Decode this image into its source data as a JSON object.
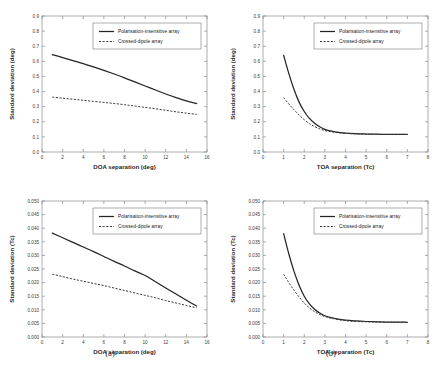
{
  "figure": {
    "caption_a": "(a)",
    "caption_b": "(b)"
  },
  "legend": {
    "series_solid": "Polarisation-insensitive array",
    "series_dashed": "Crossed-dipole array"
  },
  "chart_data": [
    {
      "id": "top-left",
      "type": "line",
      "title": "",
      "xlabel": "DOA separation (deg)",
      "ylabel": "Standard deviation (deg)",
      "xlim": [
        0,
        16
      ],
      "ylim": [
        0,
        0.9
      ],
      "xticks": [
        0,
        2,
        4,
        6,
        8,
        10,
        12,
        14,
        16
      ],
      "xticklabels": [
        "0",
        "2",
        "4",
        "6",
        "8",
        "10",
        "12",
        "14",
        "16"
      ],
      "yticks": [
        0,
        0.1,
        0.2,
        0.3,
        0.4,
        0.5,
        0.6,
        0.7,
        0.8,
        0.9
      ],
      "yticklabels": [
        "0.0",
        "0.1",
        "0.2",
        "0.3",
        "0.4",
        "0.5",
        "0.6",
        "0.7",
        "0.8",
        "0.9"
      ],
      "grid": false,
      "legend_position": "upper right",
      "x": [
        1,
        2,
        3,
        4,
        5,
        6,
        7,
        8,
        9,
        10,
        11,
        12,
        13,
        14,
        15
      ],
      "series": [
        {
          "name": "Polarisation-insensitive array",
          "style": "solid",
          "values": [
            0.645,
            0.625,
            0.605,
            0.585,
            0.563,
            0.54,
            0.516,
            0.491,
            0.464,
            0.437,
            0.41,
            0.384,
            0.36,
            0.338,
            0.32
          ]
        },
        {
          "name": "Crossed-dipole array",
          "style": "dashed",
          "values": [
            0.363,
            0.356,
            0.349,
            0.342,
            0.335,
            0.328,
            0.321,
            0.313,
            0.304,
            0.295,
            0.286,
            0.276,
            0.266,
            0.257,
            0.249
          ]
        }
      ]
    },
    {
      "id": "top-right",
      "type": "line",
      "title": "",
      "xlabel": "TOA separation (Tc)",
      "ylabel": "Standard deviation (deg)",
      "xlim": [
        0,
        8
      ],
      "ylim": [
        0,
        0.9
      ],
      "xticks": [
        0,
        1,
        2,
        3,
        4,
        5,
        6,
        7,
        8
      ],
      "xticklabels": [
        "0",
        "1",
        "2",
        "3",
        "4",
        "5",
        "6",
        "7",
        "8"
      ],
      "yticks": [
        0,
        0.1,
        0.2,
        0.3,
        0.4,
        0.5,
        0.6,
        0.7,
        0.8,
        0.9
      ],
      "yticklabels": [
        "0.0",
        "0.1",
        "0.2",
        "0.3",
        "0.4",
        "0.5",
        "0.6",
        "0.7",
        "0.8",
        "0.9"
      ],
      "grid": false,
      "legend_position": "upper right",
      "x": [
        1,
        1.25,
        1.5,
        1.75,
        2,
        2.25,
        2.5,
        2.75,
        3,
        3.25,
        3.5,
        4,
        4.5,
        5,
        5.5,
        6,
        6.5,
        7
      ],
      "series": [
        {
          "name": "Polarisation-insensitive array",
          "style": "solid",
          "values": [
            0.64,
            0.52,
            0.415,
            0.33,
            0.268,
            0.222,
            0.19,
            0.167,
            0.15,
            0.14,
            0.133,
            0.125,
            0.121,
            0.119,
            0.118,
            0.117,
            0.117,
            0.117
          ]
        },
        {
          "name": "Crossed-dipole array",
          "style": "dashed",
          "values": [
            0.36,
            0.318,
            0.28,
            0.245,
            0.214,
            0.188,
            0.168,
            0.153,
            0.142,
            0.135,
            0.13,
            0.123,
            0.12,
            0.118,
            0.117,
            0.116,
            0.116,
            0.116
          ]
        }
      ]
    },
    {
      "id": "bottom-left",
      "type": "line",
      "title": "",
      "xlabel": "DOA separation (deg)",
      "ylabel": "Standard deviation (Tc)",
      "xlim": [
        0,
        16
      ],
      "ylim": [
        0,
        0.05
      ],
      "xticks": [
        0,
        2,
        4,
        6,
        8,
        10,
        12,
        14,
        16
      ],
      "xticklabels": [
        "0",
        "2",
        "4",
        "6",
        "8",
        "10",
        "12",
        "14",
        "16"
      ],
      "yticks": [
        0,
        0.005,
        0.01,
        0.015,
        0.02,
        0.025,
        0.03,
        0.035,
        0.04,
        0.045,
        0.05
      ],
      "yticklabels": [
        "0.000",
        "0.005",
        "0.010",
        "0.015",
        "0.020",
        "0.025",
        "0.030",
        "0.035",
        "0.040",
        "0.045",
        "0.050"
      ],
      "grid": false,
      "legend_position": "upper right",
      "x": [
        1,
        2,
        3,
        4,
        5,
        6,
        7,
        8,
        9,
        10,
        11,
        12,
        13,
        14,
        15
      ],
      "series": [
        {
          "name": "Polarisation-insensitive array",
          "style": "solid",
          "values": [
            0.0382,
            0.0365,
            0.0348,
            0.0331,
            0.0314,
            0.0296,
            0.0278,
            0.0261,
            0.0243,
            0.0226,
            0.0203,
            0.018,
            0.0158,
            0.0135,
            0.0114
          ]
        },
        {
          "name": "Crossed-dipole array",
          "style": "dashed",
          "values": [
            0.0231,
            0.0222,
            0.0213,
            0.0205,
            0.0197,
            0.0189,
            0.018,
            0.0171,
            0.0162,
            0.0153,
            0.0144,
            0.0134,
            0.0125,
            0.0116,
            0.0107
          ]
        }
      ]
    },
    {
      "id": "bottom-right",
      "type": "line",
      "title": "",
      "xlabel": "TOA separation (Tc)",
      "ylabel": "Standard deviation (Tc)",
      "xlim": [
        0,
        8
      ],
      "ylim": [
        0,
        0.05
      ],
      "xticks": [
        0,
        1,
        2,
        3,
        4,
        5,
        6,
        7,
        8
      ],
      "xticklabels": [
        "0",
        "1",
        "2",
        "3",
        "4",
        "5",
        "6",
        "7",
        "8"
      ],
      "yticks": [
        0,
        0.005,
        0.01,
        0.015,
        0.02,
        0.025,
        0.03,
        0.035,
        0.04,
        0.045,
        0.05
      ],
      "yticklabels": [
        "0.000",
        "0.005",
        "0.010",
        "0.015",
        "0.020",
        "0.025",
        "0.030",
        "0.035",
        "0.040",
        "0.045",
        "0.050"
      ],
      "grid": false,
      "legend_position": "upper right",
      "x": [
        1,
        1.25,
        1.5,
        1.75,
        2,
        2.25,
        2.5,
        2.75,
        3,
        3.25,
        3.5,
        4,
        4.5,
        5,
        5.5,
        6,
        6.5,
        7
      ],
      "series": [
        {
          "name": "Polarisation-insensitive array",
          "style": "solid",
          "values": [
            0.038,
            0.0306,
            0.0242,
            0.019,
            0.015,
            0.0122,
            0.0102,
            0.0088,
            0.0078,
            0.0072,
            0.0068,
            0.0062,
            0.0059,
            0.0057,
            0.0056,
            0.0055,
            0.0055,
            0.0054
          ]
        },
        {
          "name": "Crossed-dipole array",
          "style": "dashed",
          "values": [
            0.0231,
            0.02,
            0.0172,
            0.0147,
            0.0125,
            0.0107,
            0.0093,
            0.0083,
            0.0075,
            0.007,
            0.0066,
            0.006,
            0.0057,
            0.0056,
            0.0055,
            0.0054,
            0.0054,
            0.0053
          ]
        }
      ]
    }
  ]
}
